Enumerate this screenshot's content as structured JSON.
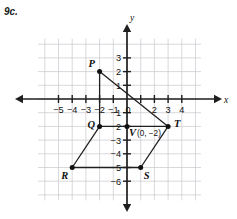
{
  "problem": {
    "number": "9c."
  },
  "chart_data": {
    "type": "scatter",
    "title": "",
    "xlabel": "x",
    "ylabel": "y",
    "xlim": [
      -6.6,
      5.4
    ],
    "ylim": [
      -7.4,
      4.4
    ],
    "grid": true,
    "grid_spacing": 1,
    "legend": "none",
    "x_tick_labels": [
      "-5",
      "-4",
      "-3",
      "-2",
      "-1",
      "0",
      "2",
      "3",
      "4"
    ],
    "x_tick_values": [
      -5,
      -4,
      -3,
      -2,
      -1,
      0,
      2,
      3,
      4
    ],
    "y_tick_labels": [
      "3",
      "2",
      "1",
      "-1",
      "-2",
      "-3",
      "-4",
      "-5",
      "-6"
    ],
    "y_tick_values": [
      3,
      2,
      1,
      -1,
      -2,
      -3,
      -4,
      -5,
      -6
    ],
    "points": [
      {
        "name": "P",
        "x": -2,
        "y": 2,
        "label": "P",
        "label_dx": -11,
        "label_dy": -5
      },
      {
        "name": "T",
        "x": 3,
        "y": -2,
        "label": "T",
        "label_dx": 6,
        "label_dy": 1
      },
      {
        "name": "S",
        "x": 1,
        "y": -5,
        "label": "S",
        "label_dx": 3,
        "label_dy": 11
      },
      {
        "name": "R",
        "x": -4,
        "y": -5,
        "label": "R",
        "label_dx": -11,
        "label_dy": 11
      },
      {
        "name": "Q",
        "x": -2,
        "y": -2,
        "label": "Q",
        "label_dx": -12,
        "label_dy": 2
      },
      {
        "name": "V",
        "x": 0,
        "y": -2,
        "label": "V",
        "label_dx": 2,
        "label_dy": 10
      }
    ],
    "annotations": [
      {
        "name": "V-coordinate",
        "text": "(0, −2)",
        "x": 0,
        "y": -2,
        "dx": 10,
        "dy": 10
      }
    ],
    "polygon": {
      "name": "PTSRQ",
      "closed": true,
      "vertices": [
        "P",
        "T",
        "S",
        "R",
        "Q"
      ]
    },
    "segments": [
      {
        "from": "P",
        "to": "T"
      },
      {
        "from": "T",
        "to": "S"
      },
      {
        "from": "S",
        "to": "R"
      },
      {
        "from": "R",
        "to": "Q"
      },
      {
        "from": "Q",
        "to": "P"
      },
      {
        "from": "Q",
        "to": "T"
      }
    ],
    "colors": {
      "grid": "#c9c9cf",
      "axis": "#1f1f1f",
      "shape": "#1f1f1f",
      "point": "#111111",
      "background": "#ffffff"
    }
  }
}
